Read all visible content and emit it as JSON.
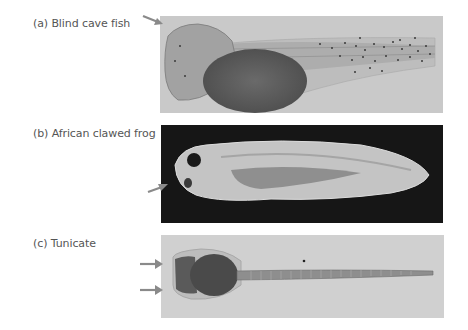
{
  "figure": {
    "panels": [
      {
        "id": "a",
        "label": "(a) Blind cave fish",
        "image": "Lateral view of blind cave fish embryo with large yolk sac and speckled pigment cells along tail, light gray background",
        "background": "#c9c9c9",
        "arrows": 1
      },
      {
        "id": "b",
        "label": "(b) African clawed frog",
        "image": "Lateral view of African clawed frog tadpole, pale body on black background, with eye visible",
        "background": "#151515",
        "arrows": 1
      },
      {
        "id": "c",
        "label": "(c) Tunicate",
        "image": "Tunicate larva with dark head region and long segmented tail on light gray background",
        "background": "#cfcfcf",
        "arrows": 2
      }
    ],
    "arrow_color": "#8a8a8a"
  }
}
